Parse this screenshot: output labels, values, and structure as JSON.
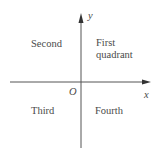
{
  "diagram": {
    "axes": {
      "x_label": "x",
      "y_label": "y",
      "origin_label": "O"
    },
    "quadrants": {
      "first_line1": "First",
      "first_line2": "quadrant",
      "second": "Second",
      "third": "Third",
      "fourth": "Fourth"
    },
    "colors": {
      "axis": "#555555",
      "text": "#4a4a4a",
      "background": "#ffffff"
    }
  }
}
